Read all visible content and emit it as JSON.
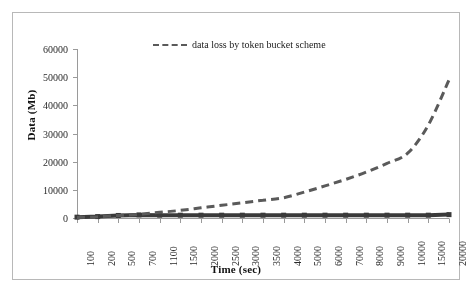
{
  "figure": {
    "background_color": "#ffffff",
    "border_color": "#b8b8b8"
  },
  "legend": {
    "position": "top-center",
    "marker": "dashed-line-marker",
    "entries": [
      {
        "label": "data loss by token bucket scheme",
        "color": "#5a5a5a",
        "style": "dashed"
      }
    ]
  },
  "axes": {
    "x_title": "Time (sec)",
    "y_title": "Data (Mb)"
  },
  "chart_data": {
    "type": "line",
    "title": "",
    "subtitle": "",
    "xlabel": "Time (sec)",
    "ylabel": "Data (Mb)",
    "grid": false,
    "legend_position": "top-center",
    "categories": [
      "100",
      "200",
      "500",
      "700",
      "1100",
      "1500",
      "2000",
      "2500",
      "3000",
      "3500",
      "4000",
      "5000",
      "6000",
      "7000",
      "8000",
      "9000",
      "10000",
      "15000",
      "20000"
    ],
    "ytick_labels": [
      "0",
      "10000",
      "20000",
      "30000",
      "40000",
      "50000",
      "60000"
    ],
    "ytick_values": [
      0,
      10000,
      20000,
      30000,
      40000,
      50000,
      60000
    ],
    "ylim": [
      0,
      60000
    ],
    "series": [
      {
        "name": "data loss by token bucket scheme",
        "color": "#5a5a5a",
        "style": "dashed",
        "width": 3,
        "values": [
          200,
          400,
          900,
          1300,
          2000,
          2700,
          3600,
          4500,
          5400,
          6300,
          7200,
          9200,
          11400,
          13700,
          16300,
          19400,
          23000,
          33000,
          49000
        ]
      },
      {
        "name": "baseline",
        "color": "#3a3a3a",
        "style": "solid",
        "width": 4,
        "values": [
          300,
          500,
          900,
          1100,
          1000,
          1000,
          1000,
          1000,
          1000,
          1000,
          1000,
          1000,
          1000,
          1000,
          1000,
          1000,
          1000,
          1000,
          1200
        ]
      }
    ]
  }
}
